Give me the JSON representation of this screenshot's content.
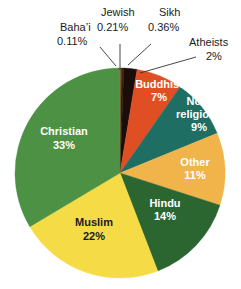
{
  "chart_data": {
    "type": "pie",
    "title": "",
    "subtitle": "",
    "xlabel": "",
    "ylabel": "",
    "legend_position": "none",
    "grid": false,
    "units": "percent",
    "start_angle_deg": 0,
    "direction": "clockwise",
    "categories": [
      "Jewish",
      "Sikh",
      "Atheists",
      "Buddhist",
      "Non-religious",
      "Other",
      "Hindu",
      "Muslim",
      "Christian",
      "Baha'i"
    ],
    "values": [
      0.21,
      0.36,
      2,
      7,
      9,
      11,
      14,
      22,
      33,
      0.11
    ],
    "slices": [
      {
        "label": "Jewish",
        "value": 0.21,
        "value_text": "0.21%",
        "color": "#7a5a2a",
        "label_placement": "callout",
        "text_color": "#1a1a1a"
      },
      {
        "label": "Sikh",
        "value": 0.36,
        "value_text": "0.36%",
        "color": "#3b1f12",
        "label_placement": "callout",
        "text_color": "#1a1a1a"
      },
      {
        "label": "Atheists",
        "value": 2,
        "value_text": "2%",
        "color": "#1a0d0a",
        "label_placement": "callout",
        "text_color": "#1a1a1a"
      },
      {
        "label": "Buddhist",
        "value": 7,
        "value_text": "7%",
        "color": "#e04e24",
        "label_placement": "inside",
        "text_color": "#ffffff"
      },
      {
        "label": "Non-religious",
        "value": 9,
        "value_text": "9%",
        "color": "#1e6e63",
        "label_placement": "inside",
        "text_color": "#ffffff"
      },
      {
        "label": "Other",
        "value": 11,
        "value_text": "11%",
        "color": "#f0b council",
        "label_placement": "inside",
        "text_color": "#ffffff"
      },
      {
        "label": "Hindu",
        "value": 14,
        "value_text": "14%",
        "color": "#2b6630",
        "label_placement": "inside",
        "text_color": "#ffffff"
      },
      {
        "label": "Muslim",
        "value": 22,
        "value_text": "22%",
        "color": "#f5dc46",
        "label_placement": "inside",
        "text_color": "#1a1a1a"
      },
      {
        "label": "Christian",
        "value": 33,
        "value_text": "33%",
        "color": "#4d9144",
        "label_placement": "inside",
        "text_color": "#ffffff"
      },
      {
        "label": "Baha'i",
        "value": 0.11,
        "value_text": "0.11%",
        "color": "#8a6a3a",
        "label_placement": "callout",
        "text_color": "#1a1a1a"
      }
    ]
  },
  "callouts": {
    "bahai": {
      "name": "Baha’i",
      "value": "0.11%"
    },
    "jewish": {
      "name": "Jewish",
      "value": "0.21%"
    },
    "sikh": {
      "name": "Sikh",
      "value": "0.36%"
    },
    "atheists": {
      "name": "Atheists",
      "value": "2%"
    }
  },
  "inside_labels": {
    "buddhist": {
      "name": "Buddhist",
      "value": "7%"
    },
    "nonreligious": {
      "name_line1": "Non-",
      "name_line2": "religious",
      "value": "9%"
    },
    "other": {
      "name": "Other",
      "value": "11%"
    },
    "hindu": {
      "name": "Hindu",
      "value": "14%"
    },
    "muslim": {
      "name": "Muslim",
      "value": "22%"
    },
    "christian": {
      "name": "Christian",
      "value": "33%"
    }
  },
  "colors": {
    "christian": "#4d9144",
    "muslim": "#f5dc46",
    "hindu": "#2b6630",
    "other": "#f0b44b",
    "nonreligious": "#1e6e63",
    "buddhist": "#e04e24",
    "atheists": "#1a0d0a",
    "sikh": "#3b1f12",
    "jewish": "#7a5a2a",
    "bahai": "#8a6a3a",
    "background": "#ffffff",
    "leader_line": "#333333",
    "callout_text": "#1a1a1a"
  }
}
